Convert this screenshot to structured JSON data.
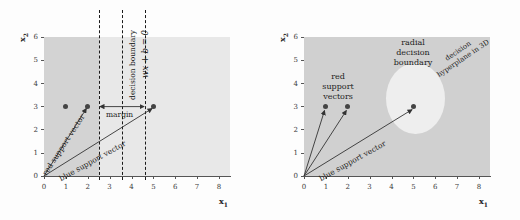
{
  "figure": {
    "title": "",
    "panels": [
      {
        "id": "linear-svm",
        "axes": {
          "xlabel": "x",
          "xlabel_sub": "1",
          "ylabel": "x",
          "ylabel_sub": "2",
          "xticks": [
            "0",
            "1",
            "2",
            "3",
            "4",
            "5",
            "6",
            "7",
            "8"
          ],
          "yticks": [
            "0",
            "1",
            "2",
            "3",
            "4",
            "5",
            "6"
          ],
          "xlim": [
            0,
            8.5
          ],
          "ylim": [
            0,
            6.4
          ]
        },
        "labels": {
          "decision_boundary": "decision boundary",
          "decision_equation": "wx + b = 0",
          "margin": "margin",
          "red_support_vector": "red support vector",
          "blue_support_vector": "blue support vector"
        },
        "boundaries": {
          "left_margin_x": 2.5,
          "decision_x": 3.55,
          "right_margin_x": 4.62
        },
        "points": [
          {
            "x": 1,
            "y": 3
          },
          {
            "x": 2,
            "y": 3
          },
          {
            "x": 5,
            "y": 3
          }
        ],
        "vectors": [
          {
            "name": "red support vector",
            "from": [
              0,
              0
            ],
            "to": [
              2,
              3
            ]
          },
          {
            "name": "blue support vector",
            "from": [
              0,
              0
            ],
            "to": [
              5,
              3
            ]
          }
        ]
      },
      {
        "id": "radial-svm",
        "axes": {
          "xlabel": "x",
          "xlabel_sub": "1",
          "ylabel": "x",
          "ylabel_sub": "2",
          "xticks": [
            "0",
            "1",
            "2",
            "3",
            "4",
            "5",
            "6",
            "7",
            "8"
          ],
          "yticks": [
            "0",
            "1",
            "2",
            "3",
            "4",
            "5",
            "6"
          ],
          "xlim": [
            0,
            8.5
          ],
          "ylim": [
            0,
            6.4
          ]
        },
        "labels": {
          "red_support_vectors_line1": "red",
          "red_support_vectors_line2": "support",
          "red_support_vectors_line3": "vectors",
          "radial_boundary_line1": "radial",
          "radial_boundary_line2": "decision",
          "radial_boundary_line3": "boundary",
          "hyperplane_line1": "decision",
          "hyperplane_line2": "hyperplane in 3D",
          "blue_support_vector": "blue support vector"
        },
        "blob": {
          "cx": 5.1,
          "cy": 3.35,
          "rx": 1.35,
          "ry": 1.55
        },
        "points": [
          {
            "x": 1,
            "y": 3
          },
          {
            "x": 2,
            "y": 3
          },
          {
            "x": 5,
            "y": 3
          }
        ],
        "vectors": [
          {
            "name": "red support vector 1",
            "from": [
              0,
              0
            ],
            "to": [
              1,
              3
            ]
          },
          {
            "name": "red support vector 2",
            "from": [
              0,
              0
            ],
            "to": [
              2,
              3
            ]
          },
          {
            "name": "blue support vector",
            "from": [
              0,
              0
            ],
            "to": [
              5,
              3
            ]
          }
        ]
      }
    ]
  },
  "colors": {
    "region_dark": "#d3d3d3",
    "region_light": "#e8e8e8",
    "blob": "#eeeeee",
    "point": "#444444",
    "axis": "#555555",
    "text": "#1c1c1c",
    "background": "#fdfdfd"
  }
}
